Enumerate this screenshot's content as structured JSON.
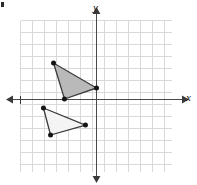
{
  "figure": {
    "title": "",
    "axis_labels": {
      "x": "x",
      "y": "y"
    },
    "corner_mark": "bullet-mark"
  },
  "chart_data": {
    "type": "scatter",
    "title": "",
    "xlabel": "x",
    "ylabel": "y",
    "xlim": [
      -6.33,
      6.33
    ],
    "ylim": [
      -6.04,
      6.62
    ],
    "grid": true,
    "grid_spacing": 1,
    "legend": "none",
    "axes": {
      "x_axis_y": 0,
      "y_axis_x": 0,
      "x_arrow_left": true,
      "x_arrow_right": true,
      "y_arrow_up": true,
      "y_arrow_down": true,
      "x_tick_marks": [
        -6.25
      ],
      "tick_labels": []
    },
    "series": [
      {
        "name": "shaded-triangle",
        "type": "polygon",
        "fill": "#b9b9b9",
        "stroke": "#3a3a3a",
        "vertices": [
          {
            "x": -3.58,
            "y": 3.04
          },
          {
            "x": -2.67,
            "y": 0.04
          },
          {
            "x": 0.0,
            "y": 0.96
          }
        ],
        "vertex_markers": true
      },
      {
        "name": "light-triangle",
        "type": "polygon",
        "fill": "#f4f4f4",
        "stroke": "#3a3a3a",
        "vertices": [
          {
            "x": -4.42,
            "y": -0.71
          },
          {
            "x": -3.83,
            "y": -2.96
          },
          {
            "x": -0.92,
            "y": -2.13
          }
        ],
        "vertex_markers": true
      }
    ]
  },
  "colors": {
    "grid_line": "#d9d9d9",
    "axis_line": "#4a4a4a",
    "marker": "#161616",
    "shaded_fill": "#b9b9b9",
    "light_fill": "#f4f4f4",
    "outline": "#3a3a3a",
    "background": "#ffffff"
  }
}
